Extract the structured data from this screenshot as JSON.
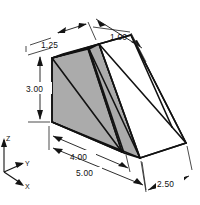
{
  "drawing": {
    "title": "Isometric Wedge Block Dimensioned Drawing",
    "background_color": "#ffffff",
    "line_color": "#121212",
    "shaded_face_color": "#ababab",
    "unshaded_face_color": "#ffffff",
    "dimensions": [
      {
        "id": "top-left-width",
        "label": "1.25",
        "x": 41,
        "y": 48
      },
      {
        "id": "top-right-width",
        "label": "1.00",
        "x": 110,
        "y": 40
      },
      {
        "id": "left-height",
        "label": "3.00",
        "x": 27,
        "y": 90
      },
      {
        "id": "base-inner-depth",
        "label": "4.00",
        "x": 81,
        "y": 160
      },
      {
        "id": "base-outer-depth",
        "label": "5.00",
        "x": 88,
        "y": 176
      },
      {
        "id": "base-width",
        "label": "2.50",
        "x": 164,
        "y": 189
      }
    ],
    "axes": {
      "label_z": "Z",
      "label_y": "Y",
      "label_x": "X"
    }
  }
}
